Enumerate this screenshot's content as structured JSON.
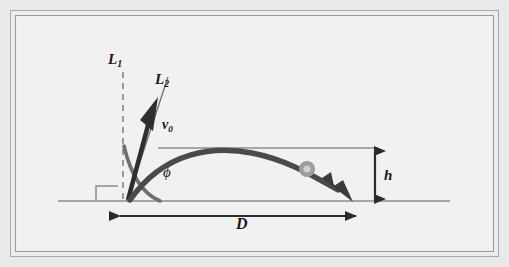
{
  "figure": {
    "background_color": "#e9e9e9",
    "panel_color": "#f2f1f1",
    "ink_color": "#2b2b2b",
    "line_color": "#8a8a8a",
    "ball_color": "#9b9b9b"
  },
  "labels": {
    "line_vertical": {
      "base": "L",
      "sub": "1"
    },
    "line_launch": {
      "base": "L",
      "sub": "2"
    },
    "velocity": {
      "base": "v",
      "sub": "0"
    },
    "angle": "ϕ",
    "height": "h",
    "range": "D"
  },
  "elements": {
    "vertical_dashed_line": {
      "name": "L1",
      "x": 123,
      "y_top": 72,
      "y_bottom": 201,
      "style": "dashed"
    },
    "launch_line": {
      "name": "L2",
      "x1": 126,
      "y1": 201,
      "x2": 167,
      "y2": 78,
      "style": "solid-thin"
    },
    "velocity_arrow": {
      "name": "v0",
      "x1": 128,
      "y1": 200,
      "x2": 155,
      "y2": 102,
      "style": "thick-arrow"
    },
    "angle_arc": {
      "name": "phi",
      "center_x": 126,
      "center_y": 201,
      "radius": 56
    },
    "right_angle_marker": {
      "x": 96,
      "y": 186,
      "width": 22,
      "height": 15
    },
    "ground_line": {
      "x1": 58,
      "y1": 201,
      "x2": 450,
      "y2": 201
    },
    "apex_reference_line": {
      "x1": 158,
      "y1": 148,
      "x2": 376,
      "y2": 148
    },
    "trajectory": {
      "start_x": 128,
      "start_y": 200,
      "apex_x": 245,
      "apex_y": 152,
      "end_x": 352,
      "end_y": 200
    },
    "ball": {
      "cx": 307,
      "cy": 169,
      "outer_radius": 8,
      "inner_radius": 4
    },
    "height_dimension": {
      "x": 375,
      "y_top": 149,
      "y_bottom": 200
    },
    "range_dimension": {
      "y": 216,
      "x_left": 118,
      "x_right": 358
    }
  }
}
